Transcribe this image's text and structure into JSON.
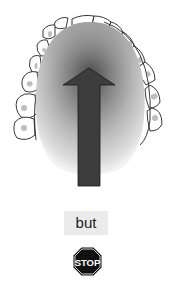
{
  "figure": {
    "arrow_direction": "up",
    "colors": {
      "palate_light": "#e6e6e6",
      "palate_dark": "#6e6e6e",
      "arrow_fill": "#3d3d3d",
      "teeth_outline": "#222222",
      "teeth_fill": "#ffffff"
    }
  },
  "caption": {
    "text": "but"
  },
  "stop_sign": {
    "text": "STOP",
    "color": "#111111"
  }
}
